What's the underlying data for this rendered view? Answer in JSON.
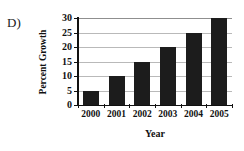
{
  "panel": {
    "label": "D)"
  },
  "chart_data": {
    "type": "bar",
    "title": "",
    "subtitle": "",
    "xlabel": "Year",
    "ylabel": "Percent Growth",
    "categories": [
      "2000",
      "2001",
      "2002",
      "2003",
      "2004",
      "2005"
    ],
    "values": [
      5,
      10,
      15,
      20,
      25,
      30
    ],
    "series": [
      {
        "name": "Percent Growth",
        "values": [
          5,
          10,
          15,
          20,
          25,
          30
        ]
      }
    ],
    "ylim": [
      0,
      30
    ],
    "yticks": [
      0,
      5,
      10,
      15,
      20,
      25,
      30
    ],
    "ytick_labels": [
      "0",
      "5",
      "10",
      "15",
      "20",
      "25",
      "30"
    ],
    "xtick_labels": [
      "2000",
      "2001",
      "2002",
      "2003",
      "2004",
      "2005"
    ],
    "grid": true,
    "grid_axis": "y",
    "legend": false,
    "legend_position": "none",
    "annotations": [],
    "colors": {
      "bar": "#1c1c1c",
      "grid": "#b9b9b9",
      "axis": "#111111",
      "text": "#111111",
      "background": "#ffffff"
    }
  }
}
